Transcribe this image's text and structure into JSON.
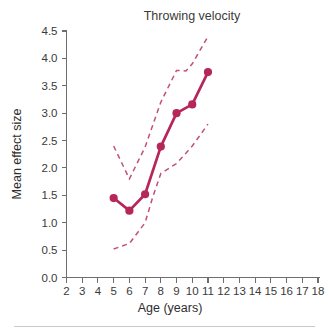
{
  "chart_data": {
    "type": "line",
    "title": "Throwing velocity",
    "xlabel": "Age (years)",
    "ylabel": "Mean effect size",
    "xlim": [
      2,
      18
    ],
    "ylim": [
      0.0,
      4.5
    ],
    "grid": false,
    "legend": "none",
    "x_ticks": [
      2,
      3,
      4,
      5,
      6,
      7,
      8,
      9,
      10,
      11,
      12,
      13,
      14,
      15,
      16,
      17,
      18
    ],
    "x_tick_labels": [
      "2",
      "3",
      "4",
      "5",
      "6",
      "7",
      "8",
      "9",
      "10",
      "11",
      "12",
      "13",
      "14",
      "15",
      "16",
      "17",
      "18"
    ],
    "y_ticks": [
      0.0,
      0.5,
      1.0,
      1.5,
      2.0,
      2.5,
      3.0,
      3.5,
      4.0,
      4.5
    ],
    "y_tick_labels": [
      "0.0",
      "0.5",
      "1.0",
      "1.5",
      "2.0",
      "2.5",
      "3.0",
      "3.5",
      "4.0",
      "4.5"
    ],
    "series": [
      {
        "name": "Mean effect size",
        "style": "solid-with-markers",
        "color": "#B5275A",
        "x": [
          5,
          6,
          7,
          8,
          9,
          10,
          11
        ],
        "values": [
          1.45,
          1.22,
          1.52,
          2.39,
          3.0,
          3.16,
          3.75
        ]
      },
      {
        "name": "Upper confidence limit",
        "style": "dashed",
        "color": "#C0517B",
        "x": [
          5,
          6,
          7,
          8,
          9,
          9.6,
          10,
          10.6,
          11
        ],
        "values": [
          2.4,
          1.8,
          2.38,
          3.2,
          3.78,
          3.77,
          3.9,
          4.2,
          4.4
        ]
      },
      {
        "name": "Lower confidence limit",
        "style": "dashed",
        "color": "#C0517B",
        "x": [
          5,
          6,
          7,
          7.5,
          8,
          9,
          10,
          11
        ],
        "values": [
          0.52,
          0.62,
          1.0,
          1.48,
          1.9,
          2.08,
          2.4,
          2.8
        ]
      }
    ]
  },
  "colors": {
    "accent": "#B5275A",
    "ci": "#C0517B",
    "axis": "#6e6e6e",
    "text": "#3a3a3a",
    "divider": "#c9c9c9",
    "background": "#ffffff"
  }
}
